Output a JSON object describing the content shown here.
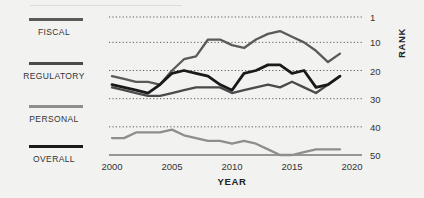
{
  "chart_data": {
    "type": "line",
    "title": "",
    "xlabel": "YEAR",
    "ylabel": "RANK",
    "x": [
      2000,
      2001,
      2002,
      2003,
      2004,
      2005,
      2006,
      2007,
      2008,
      2009,
      2010,
      2011,
      2012,
      2013,
      2014,
      2015,
      2016,
      2017,
      2018,
      2019
    ],
    "xlim": [
      2000,
      2020
    ],
    "ylim": [
      1,
      50
    ],
    "y_inverted": true,
    "xticks": [
      "2000",
      "2005",
      "2010",
      "2015",
      "2020"
    ],
    "xtick_values": [
      2000,
      2005,
      2010,
      2015,
      2020
    ],
    "yticks": [
      "1",
      "10",
      "20",
      "30",
      "40",
      "50"
    ],
    "ytick_values": [
      1,
      10,
      20,
      30,
      40,
      50
    ],
    "grid": "horizontal-dotted",
    "legend_position": "left",
    "series": [
      {
        "name": "FISCAL",
        "color": "#5a5a5a",
        "values": [
          22,
          23,
          24,
          24,
          25,
          20,
          16,
          15,
          9,
          9,
          11,
          12,
          9,
          7,
          6,
          8,
          10,
          13,
          17,
          14
        ]
      },
      {
        "name": "REGULATORY",
        "color": "#4a4a4a",
        "values": [
          26,
          27,
          28,
          29,
          29,
          28,
          27,
          26,
          26,
          26,
          28,
          27,
          26,
          25,
          26,
          24,
          26,
          28,
          25,
          22
        ]
      },
      {
        "name": "PERSONAL",
        "color": "#8e8e8e",
        "values": [
          44,
          44,
          42,
          42,
          42,
          41,
          43,
          44,
          45,
          45,
          46,
          45,
          46,
          48,
          50,
          50,
          49,
          48,
          48,
          48
        ]
      },
      {
        "name": "OVERALL",
        "color": "#1a1a1a",
        "values": [
          25,
          26,
          27,
          28,
          25,
          21,
          20,
          21,
          22,
          25,
          27,
          21,
          20,
          18,
          18,
          21,
          20,
          26,
          25,
          22
        ]
      }
    ]
  },
  "legend": {
    "items": [
      {
        "label": "FISCAL",
        "color": "#5a5a5a"
      },
      {
        "label": "REGULATORY",
        "color": "#4a4a4a"
      },
      {
        "label": "PERSONAL",
        "color": "#8e8e8e"
      },
      {
        "label": "OVERALL",
        "color": "#1a1a1a"
      }
    ]
  },
  "axes": {
    "x_title": "YEAR",
    "y_title": "RANK"
  }
}
